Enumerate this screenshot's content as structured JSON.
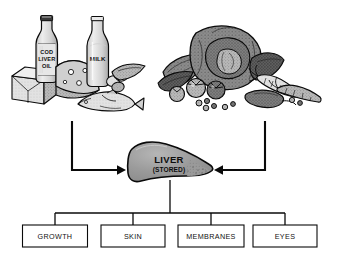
{
  "diagram": {
    "colors": {
      "outline": "#0a0a0a",
      "liver_fill": "#969696",
      "liver_highlight": "#b4b4b4",
      "box_fill": "#ffffff",
      "background": "#ffffff",
      "food_light": "#d8d8d8",
      "food_mid": "#a8a8a8",
      "food_dark": "#6e6e6e",
      "veg_dark": "#5a5a5a",
      "veg_mid": "#8f8f8f"
    }
  },
  "sources": {
    "animal_group": {
      "name": "animal-foods-illustration",
      "items": [
        {
          "name": "butter-block",
          "label": ""
        },
        {
          "name": "cod-liver-oil-bottle",
          "label": "COD LIVER OIL",
          "label_lines": [
            "COD",
            "LIVER",
            "OIL"
          ]
        },
        {
          "name": "cheese-wedge",
          "label": ""
        },
        {
          "name": "milk-bottle",
          "label": "MILK",
          "label_lines": [
            "MILK"
          ]
        },
        {
          "name": "eggs",
          "label": ""
        },
        {
          "name": "fish",
          "label": ""
        }
      ]
    },
    "plant_group": {
      "name": "vegetables-illustration",
      "items": [
        {
          "name": "cabbage",
          "label": ""
        },
        {
          "name": "leafy-greens",
          "label": ""
        },
        {
          "name": "tomatoes",
          "label": ""
        },
        {
          "name": "carrots",
          "label": ""
        },
        {
          "name": "peas",
          "label": ""
        },
        {
          "name": "squash",
          "label": ""
        }
      ]
    }
  },
  "organ": {
    "name": "liver",
    "label": "LIVER",
    "sublabel": "(STORED)"
  },
  "outputs": {
    "boxes": [
      {
        "label": "GROWTH"
      },
      {
        "label": "SKIN"
      },
      {
        "label": "MEMBRANES"
      },
      {
        "label": "EYES"
      }
    ]
  },
  "arrows": {
    "left_source_to_liver": "arrow-animal-foods-to-liver",
    "right_source_to_liver": "arrow-vegetables-to-liver",
    "liver_to_outputs": "connector-liver-to-functions"
  }
}
